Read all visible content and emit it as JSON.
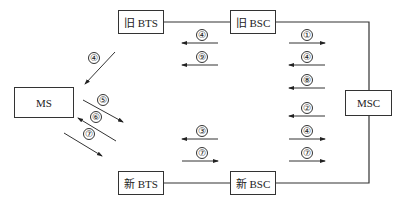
{
  "diagram": {
    "type": "handover signaling flow",
    "nodes": {
      "ms": {
        "label": "MS"
      },
      "old_bts": {
        "label": "旧 BTS"
      },
      "old_bsc": {
        "label": "旧 BSC"
      },
      "msc": {
        "label": "MSC"
      },
      "new_bts": {
        "label": "新 BTS"
      },
      "new_bsc": {
        "label": "新 BSC"
      }
    },
    "messages": {
      "old_bts_side": [
        {
          "num": "④",
          "direction": "left"
        },
        {
          "num": "⑨",
          "direction": "left"
        }
      ],
      "old_bsc_msc": [
        {
          "num": "①",
          "direction": "right"
        },
        {
          "num": "④",
          "direction": "left"
        },
        {
          "num": "⑧",
          "direction": "left"
        }
      ],
      "new_bsc_msc": [
        {
          "num": "②",
          "direction": "left"
        },
        {
          "num": "④",
          "direction": "right"
        },
        {
          "num": "⑦",
          "direction": "right"
        }
      ],
      "new_bts_side": [
        {
          "num": "③",
          "direction": "left"
        },
        {
          "num": "⑦",
          "direction": "right"
        }
      ],
      "ms_side": [
        {
          "num": "④",
          "direction": "toward-ms"
        },
        {
          "num": "⑤",
          "direction": "away-from-ms"
        },
        {
          "num": "⑥",
          "direction": "toward-ms"
        },
        {
          "num": "⑦",
          "direction": "away-from-ms"
        }
      ]
    }
  }
}
